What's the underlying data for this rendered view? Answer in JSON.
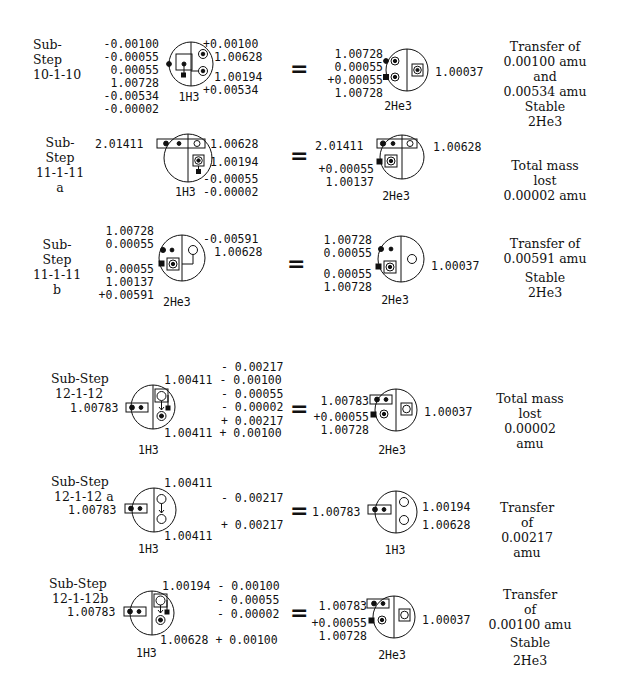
{
  "substeps": [
    {
      "id": "10-1-10",
      "title": [
        "Sub-",
        "Step",
        "10-1-10"
      ],
      "left": {
        "label": "1H3",
        "left_values": [
          "-0.00100",
          "-0.00055",
          "0.00055",
          "1.00728",
          "-0.00534",
          "-0.00002"
        ],
        "right_values": [
          "+0.00100",
          "1.00628",
          "1.00194",
          "+0.00534"
        ]
      },
      "right": {
        "label": "2He3",
        "left_values": [
          "1.00728",
          "0.00055",
          "+0.00055",
          "1.00728"
        ],
        "right_values": [
          "1.00037"
        ]
      },
      "description": [
        "Transfer of",
        "0.00100 amu",
        "and",
        "0.00534 amu",
        "Stable",
        "2He3"
      ]
    },
    {
      "id": "11-1-11 a",
      "title": [
        "Sub-",
        "Step",
        "11-1-11",
        "a"
      ],
      "left": {
        "label": "1H3",
        "left_values": [
          "2.01411"
        ],
        "right_values": [
          "1.00628",
          "1.00194",
          "-0.00055",
          "-0.00002"
        ]
      },
      "right": {
        "label": "2He3",
        "left_values": [
          "2.01411",
          "+0.00055",
          "1.00137"
        ],
        "right_values": [
          "1.00628"
        ]
      },
      "description": [
        "Total mass",
        "lost",
        "0.00002 amu"
      ]
    },
    {
      "id": "11-1-11 b",
      "title": [
        "Sub-",
        "Step",
        "11-1-11",
        "b"
      ],
      "left": {
        "label": "2He3",
        "left_values": [
          "1.00728",
          "0.00055",
          "0.00055",
          "1.00137",
          "+0.00591"
        ],
        "right_values": [
          "-0.00591",
          "1.00628"
        ]
      },
      "right": {
        "label": "2He3",
        "left_values": [
          "1.00728",
          "0.00055",
          "0.00055",
          "1.00728"
        ],
        "right_values": [
          "1.00037"
        ]
      },
      "description": [
        "Transfer of",
        "0.00591 amu",
        "Stable",
        "2He3"
      ]
    },
    {
      "id": "12-1-12",
      "title": [
        "Sub-Step",
        "12-1-12"
      ],
      "left": {
        "label": "1H3",
        "left_values": [
          "1.00783"
        ],
        "right_values": [
          "- 0.00217",
          "1.00411 - 0.00100",
          "- 0.00055",
          "- 0.00002",
          "+ 0.00217",
          "1.00411 + 0.00100"
        ]
      },
      "right": {
        "label": "2He3",
        "left_values": [
          "1.00783",
          "+0.00055",
          "1.00728"
        ],
        "right_values": [
          "1.00037"
        ]
      },
      "description": [
        "Total mass",
        "lost",
        "0.00002",
        "amu"
      ]
    },
    {
      "id": "12-1-12 a",
      "title": [
        "Sub-Step",
        "12-1-12 a"
      ],
      "left": {
        "label": "1H3",
        "left_values": [
          "1.00783"
        ],
        "right_values": [
          "1.00411",
          "- 0.00217",
          "+ 0.00217",
          "1.00411"
        ]
      },
      "right": {
        "label": "1H3",
        "left_values": [
          "1.00783"
        ],
        "right_values": [
          "1.00194",
          "1.00628"
        ]
      },
      "description": [
        "Transfer",
        "of",
        "0.00217",
        "amu"
      ]
    },
    {
      "id": "12-1-12b",
      "title": [
        "Sub-Step",
        "12-1-12b"
      ],
      "left": {
        "label": "1H3",
        "left_values": [
          "1.00783"
        ],
        "right_values": [
          "1.00194 - 0.00100",
          "- 0.00055",
          "- 0.00002",
          "1.00628 + 0.00100"
        ]
      },
      "right": {
        "label": "2He3",
        "left_values": [
          "1.00783",
          "+0.00055",
          "1.00728"
        ],
        "right_values": [
          "1.00037"
        ]
      },
      "description": [
        "Transfer",
        "of",
        "0.00100 amu",
        "Stable",
        "2He3"
      ]
    }
  ],
  "symbols": {
    "equals": "="
  }
}
